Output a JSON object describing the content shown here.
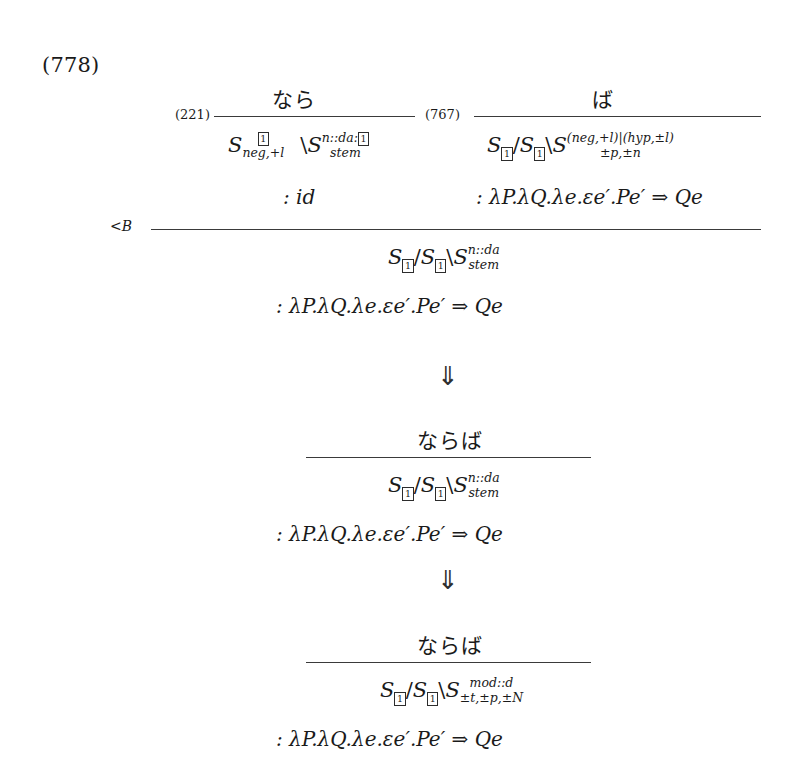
{
  "figure": {
    "example_number": "(778)",
    "rule_label_main": "<B",
    "arrow_glyph": "⇓"
  },
  "derivation": {
    "premises": [
      {
        "ref": "(221)",
        "surface": "なら",
        "category": {
          "parts": [
            {
              "text": "S",
              "kind": "base"
            },
            {
              "text": "1",
              "kind": "boxed-index"
            },
            {
              "text": "neg,+l",
              "kind": "feature-sub"
            },
            {
              "text": "\\",
              "kind": "slash"
            },
            {
              "text": "S",
              "kind": "base"
            },
            {
              "text": "n::da:",
              "kind": "sub"
            },
            {
              "text": "1",
              "kind": "boxed-index"
            },
            {
              "text": "stem",
              "kind": "feature-sub"
            }
          ],
          "plain": "S_[1],neg,+l \\ S_n::da:[1],stem"
        },
        "semantics": ": id"
      },
      {
        "ref": "(767)",
        "surface": "ば",
        "category": {
          "parts": [
            {
              "text": "S",
              "kind": "base"
            },
            {
              "text": "1",
              "kind": "boxed-index"
            },
            {
              "text": "/",
              "kind": "slash"
            },
            {
              "text": "S",
              "kind": "base"
            },
            {
              "text": "1",
              "kind": "boxed-index"
            },
            {
              "text": "\\",
              "kind": "slash"
            },
            {
              "text": "S",
              "kind": "base"
            },
            {
              "text": "(neg,+l)|(hyp,±l)",
              "kind": "sub"
            },
            {
              "text": "±p,±n",
              "kind": "feature-sub"
            }
          ],
          "plain": "S_[1]/S_[1]\\S_(neg,+l)|(hyp,±l),±p,±n"
        },
        "semantics": ": λP.λQ.λe.εe′.Pe′ ⇒ Qe"
      }
    ],
    "conclusion": {
      "category_plain": "S_[1]/S_[1]\\S_n::da,stem",
      "category_sub_top": "n::da",
      "category_sub_bottom": "stem",
      "semantics": ": λP.λQ.λe.εe′.Pe′ ⇒ Qe"
    }
  },
  "stage2": {
    "surface": "ならば",
    "category_plain": "S_[1]/S_[1]\\S_n::da,stem",
    "category_sub_top": "n::da",
    "category_sub_bottom": "stem",
    "semantics": ": λP.λQ.λe.εe′.Pe′ ⇒ Qe"
  },
  "stage3": {
    "surface": "ならば",
    "category_plain": "S_[1]/S_[1]\\S_mod::d,±t,±p,±N",
    "category_sub_top": "mod::d",
    "category_sub_bottom": "±t,±p,±N",
    "semantics": ": λP.λQ.λe.εe′.Pe′ ⇒ Qe"
  },
  "symbols": {
    "S": "S",
    "slash_forward": "/",
    "slash_back": "\\",
    "index_one": "1",
    "colon": ":"
  }
}
